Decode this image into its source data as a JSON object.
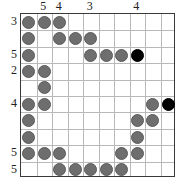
{
  "puzzle": {
    "type": "nurikabe-grid",
    "rows": 10,
    "cols": 10,
    "colors": {
      "gray_stone": "#6e6e6e",
      "black_stone": "#000000",
      "grid_line": "#b9b9b9",
      "border": "#3a3a3a",
      "background": "#ffffff",
      "label_text": "#222222"
    },
    "column_headers": [
      {
        "col": 1,
        "label": ""
      },
      {
        "col": 2,
        "label": "5"
      },
      {
        "col": 3,
        "label": "4"
      },
      {
        "col": 4,
        "label": ""
      },
      {
        "col": 5,
        "label": "3"
      },
      {
        "col": 6,
        "label": ""
      },
      {
        "col": 7,
        "label": ""
      },
      {
        "col": 8,
        "label": "4"
      },
      {
        "col": 9,
        "label": ""
      },
      {
        "col": 10,
        "label": ""
      }
    ],
    "row_headers": [
      {
        "row": 1,
        "label": "3"
      },
      {
        "row": 2,
        "label": ""
      },
      {
        "row": 3,
        "label": "5"
      },
      {
        "row": 4,
        "label": "2"
      },
      {
        "row": 5,
        "label": ""
      },
      {
        "row": 6,
        "label": "4"
      },
      {
        "row": 7,
        "label": ""
      },
      {
        "row": 8,
        "label": ""
      },
      {
        "row": 9,
        "label": "5"
      },
      {
        "row": 10,
        "label": "5"
      }
    ],
    "stones": [
      {
        "row": 1,
        "col": 1,
        "color": "gray"
      },
      {
        "row": 1,
        "col": 2,
        "color": "gray"
      },
      {
        "row": 1,
        "col": 3,
        "color": "gray"
      },
      {
        "row": 2,
        "col": 1,
        "color": "gray"
      },
      {
        "row": 2,
        "col": 3,
        "color": "gray"
      },
      {
        "row": 2,
        "col": 4,
        "color": "gray"
      },
      {
        "row": 2,
        "col": 5,
        "color": "gray"
      },
      {
        "row": 3,
        "col": 1,
        "color": "gray"
      },
      {
        "row": 3,
        "col": 5,
        "color": "gray"
      },
      {
        "row": 3,
        "col": 6,
        "color": "gray"
      },
      {
        "row": 3,
        "col": 7,
        "color": "gray"
      },
      {
        "row": 3,
        "col": 8,
        "color": "black"
      },
      {
        "row": 4,
        "col": 1,
        "color": "gray"
      },
      {
        "row": 4,
        "col": 2,
        "color": "gray"
      },
      {
        "row": 5,
        "col": 2,
        "color": "gray"
      },
      {
        "row": 6,
        "col": 1,
        "color": "gray"
      },
      {
        "row": 6,
        "col": 2,
        "color": "gray"
      },
      {
        "row": 6,
        "col": 9,
        "color": "gray"
      },
      {
        "row": 6,
        "col": 10,
        "color": "black"
      },
      {
        "row": 7,
        "col": 1,
        "color": "gray"
      },
      {
        "row": 7,
        "col": 8,
        "color": "gray"
      },
      {
        "row": 7,
        "col": 9,
        "color": "gray"
      },
      {
        "row": 8,
        "col": 1,
        "color": "gray"
      },
      {
        "row": 8,
        "col": 8,
        "color": "gray"
      },
      {
        "row": 9,
        "col": 1,
        "color": "gray"
      },
      {
        "row": 9,
        "col": 2,
        "color": "gray"
      },
      {
        "row": 9,
        "col": 3,
        "color": "gray"
      },
      {
        "row": 9,
        "col": 7,
        "color": "gray"
      },
      {
        "row": 9,
        "col": 8,
        "color": "gray"
      },
      {
        "row": 10,
        "col": 3,
        "color": "gray"
      },
      {
        "row": 10,
        "col": 4,
        "color": "gray"
      },
      {
        "row": 10,
        "col": 5,
        "color": "gray"
      },
      {
        "row": 10,
        "col": 6,
        "color": "gray"
      },
      {
        "row": 10,
        "col": 7,
        "color": "gray"
      }
    ]
  }
}
